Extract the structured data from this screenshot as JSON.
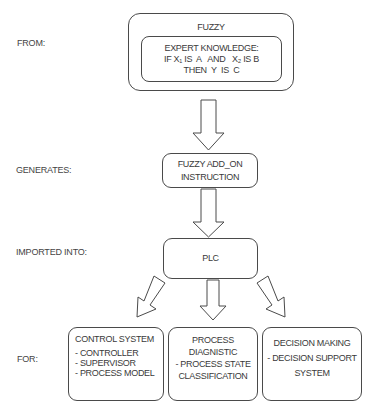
{
  "side_labels": {
    "from": "FROM:",
    "generates": "GENERATES:",
    "imported_into": "IMPORTED INTO:",
    "for": "FOR:"
  },
  "fuzzy_box": {
    "title": "FUZZY",
    "expert": {
      "heading": "EXPERT KNOWLEDGE:",
      "rule_line1": "IF X₁ IS  A   AND   X₂ IS B",
      "rule_line2": "THEN  Y  IS  C"
    }
  },
  "addon_box": {
    "line1": "FUZZY ADD_ON",
    "line2": "INSTRUCTION"
  },
  "plc_box": {
    "label": "PLC"
  },
  "targets": [
    {
      "title": "CONTROL SYSTEM",
      "items": [
        "- CONTROLLER",
        "- SUPERVISOR",
        "- PROCESS MODEL"
      ]
    },
    {
      "title_line1": "PROCESS",
      "title_line2": "DIAGNISTIC",
      "item_line1": "- PROCESS STATE",
      "item_line2": "CLASSIFICATION"
    },
    {
      "title": "DECISION MAKING",
      "item_line1": "- DECISION SUPPORT",
      "item_line2": "SYSTEM"
    }
  ],
  "colors": {
    "stroke": "#4a4a4a",
    "text": "#3a3a3a",
    "background": "#ffffff"
  }
}
